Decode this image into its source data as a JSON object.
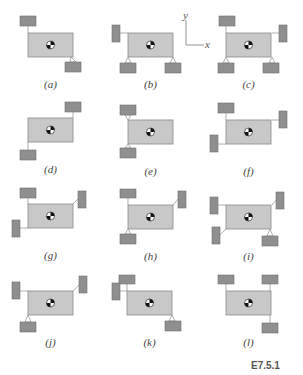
{
  "figure": {
    "id_label": "E7.5.1",
    "colors": {
      "body_fill": "#c8c8c8",
      "body_stroke": "#8a8a8a",
      "block_fill": "#8f8f8f",
      "block_stroke": "#6e6e6e",
      "link": "#9a9a9a"
    },
    "axes": {
      "y_label": "y",
      "x_label": "x"
    }
  },
  "panels": [
    {
      "label": "(a)",
      "ox": 28,
      "oy": 33,
      "blocks": [
        {
          "x": 20,
          "y": 16,
          "w": 16,
          "h": 10,
          "link": [
            28,
            26,
            28,
            33
          ]
        },
        {
          "x": 65,
          "y": 62,
          "w": 16,
          "h": 10,
          "tri": [
            71,
            57,
            73,
            62
          ]
        }
      ]
    },
    {
      "label": "(b)",
      "ox": 128,
      "oy": 33,
      "blocks": [
        {
          "x": 112,
          "y": 25,
          "w": 8,
          "h": 17,
          "link": [
            120,
            33,
            128,
            33
          ]
        },
        {
          "x": 120,
          "y": 63,
          "w": 16,
          "h": 10,
          "tri": [
            128,
            57,
            128,
            63
          ]
        },
        {
          "x": 165,
          "y": 63,
          "w": 16,
          "h": 10,
          "tri": [
            173,
            57,
            173,
            63
          ]
        }
      ]
    },
    {
      "label": "(c)",
      "ox": 226,
      "oy": 33,
      "blocks": [
        {
          "x": 219,
          "y": 16,
          "w": 16,
          "h": 10,
          "link": [
            226,
            26,
            226,
            33
          ]
        },
        {
          "x": 279,
          "y": 25,
          "w": 8,
          "h": 17,
          "link": [
            272,
            33,
            279,
            33
          ]
        },
        {
          "x": 218,
          "y": 63,
          "w": 16,
          "h": 10,
          "tri": [
            226,
            57,
            226,
            63
          ]
        },
        {
          "x": 263,
          "y": 63,
          "w": 16,
          "h": 10,
          "tri": [
            272,
            57,
            272,
            63
          ]
        }
      ]
    },
    {
      "label": "(d)",
      "ox": 28,
      "oy": 118,
      "blocks": [
        {
          "x": 65,
          "y": 102,
          "w": 16,
          "h": 10,
          "link": [
            73,
            112,
            73,
            118
          ]
        },
        {
          "x": 20,
          "y": 150,
          "w": 16,
          "h": 10,
          "link": [
            28,
            142,
            28,
            150
          ]
        }
      ]
    },
    {
      "label": "(e)",
      "ox": 128,
      "oy": 120,
      "blocks": [
        {
          "x": 120,
          "y": 105,
          "w": 16,
          "h": 10,
          "tri": [
            128,
            120,
            128,
            115
          ]
        },
        {
          "x": 120,
          "y": 148,
          "w": 16,
          "h": 10,
          "tri": [
            128,
            144,
            128,
            148
          ]
        }
      ]
    },
    {
      "label": "(f)",
      "ox": 226,
      "oy": 120,
      "blocks": [
        {
          "x": 218,
          "y": 103,
          "w": 16,
          "h": 10,
          "link": [
            226,
            113,
            226,
            120
          ]
        },
        {
          "x": 279,
          "y": 111,
          "w": 8,
          "h": 17,
          "link": [
            272,
            120,
            279,
            120
          ]
        },
        {
          "x": 210,
          "y": 135,
          "w": 8,
          "h": 17,
          "link": [
            218,
            144,
            226,
            144
          ]
        }
      ]
    },
    {
      "label": "(g)",
      "ox": 28,
      "oy": 204,
      "blocks": [
        {
          "x": 20,
          "y": 188,
          "w": 16,
          "h": 10,
          "link": [
            28,
            198,
            28,
            204
          ]
        },
        {
          "x": 78,
          "y": 191,
          "w": 8,
          "h": 17,
          "link": [
            73,
            204,
            78,
            199
          ]
        },
        {
          "x": 12,
          "y": 220,
          "w": 8,
          "h": 17,
          "link": [
            20,
            228,
            28,
            228
          ]
        }
      ]
    },
    {
      "label": "(h)",
      "ox": 128,
      "oy": 205,
      "blocks": [
        {
          "x": 120,
          "y": 189,
          "w": 16,
          "h": 9,
          "link": [
            128,
            198,
            128,
            205
          ]
        },
        {
          "x": 178,
          "y": 191,
          "w": 8,
          "h": 17,
          "link": [
            173,
            205,
            178,
            199
          ]
        },
        {
          "x": 120,
          "y": 234,
          "w": 16,
          "h": 10,
          "tri": [
            128,
            229,
            128,
            234
          ]
        }
      ]
    },
    {
      "label": "(i)",
      "ox": 226,
      "oy": 205,
      "blocks": [
        {
          "x": 210,
          "y": 197,
          "w": 8,
          "h": 17,
          "link": [
            218,
            205,
            226,
            205
          ]
        },
        {
          "x": 276,
          "y": 192,
          "w": 8,
          "h": 17,
          "link": [
            272,
            205,
            276,
            200
          ]
        },
        {
          "x": 212,
          "y": 227,
          "w": 8,
          "h": 17,
          "link": [
            220,
            235,
            226,
            229
          ]
        },
        {
          "x": 262,
          "y": 236,
          "w": 16,
          "h": 10,
          "tri": [
            270,
            229,
            270,
            236
          ]
        }
      ]
    },
    {
      "label": "(j)",
      "ox": 28,
      "oy": 291,
      "blocks": [
        {
          "x": 12,
          "y": 282,
          "w": 8,
          "h": 17,
          "link": [
            20,
            291,
            28,
            291
          ]
        },
        {
          "x": 79,
          "y": 276,
          "w": 8,
          "h": 17,
          "link": [
            73,
            291,
            79,
            285
          ]
        },
        {
          "x": 20,
          "y": 322,
          "w": 16,
          "h": 10,
          "tri": [
            28,
            315,
            28,
            322
          ]
        }
      ]
    },
    {
      "label": "(k)",
      "ox": 127,
      "oy": 291,
      "blocks": [
        {
          "x": 119,
          "y": 275,
          "w": 16,
          "h": 9,
          "link": [
            127,
            284,
            127,
            291
          ]
        },
        {
          "x": 112,
          "y": 283,
          "w": 8,
          "h": 17,
          "link": [
            120,
            291,
            127,
            291
          ]
        },
        {
          "x": 165,
          "y": 321,
          "w": 16,
          "h": 10,
          "tri": [
            172,
            315,
            172,
            321
          ]
        }
      ]
    },
    {
      "label": "(l)",
      "ox": 226,
      "oy": 291,
      "blocks": [
        {
          "x": 218,
          "y": 275,
          "w": 16,
          "h": 9,
          "link": [
            226,
            284,
            226,
            291
          ]
        },
        {
          "x": 262,
          "y": 275,
          "w": 16,
          "h": 9,
          "link": [
            270,
            284,
            270,
            291
          ]
        },
        {
          "x": 262,
          "y": 323,
          "w": 16,
          "h": 10,
          "link": [
            270,
            315,
            270,
            323
          ]
        }
      ]
    }
  ]
}
